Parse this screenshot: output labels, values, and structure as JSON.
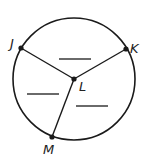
{
  "figure": {
    "type": "circle-with-radii",
    "center": {
      "label": "L",
      "x": 74,
      "y": 79
    },
    "circle": {
      "cx": 74,
      "cy": 79,
      "r": 61
    },
    "points": [
      {
        "label": "J",
        "x": 21,
        "y": 48
      },
      {
        "label": "K",
        "x": 126,
        "y": 49
      },
      {
        "label": "M",
        "x": 52,
        "y": 137
      }
    ],
    "blanks": [
      {
        "name": "arc-JK-blank",
        "x1": 59,
        "y1": 59,
        "x2": 91,
        "y2": 59
      },
      {
        "name": "arc-JM-blank",
        "x1": 27,
        "y1": 94,
        "x2": 59,
        "y2": 94
      },
      {
        "name": "arc-KM-blank",
        "x1": 76,
        "y1": 106,
        "x2": 108,
        "y2": 106
      }
    ],
    "colors": {
      "stroke": "#1a1a1a",
      "text": "#222222"
    }
  },
  "labels": {
    "J": "J",
    "K": "K",
    "L": "L",
    "M": "M"
  }
}
